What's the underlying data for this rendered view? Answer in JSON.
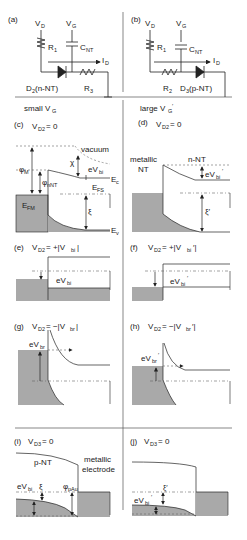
{
  "panels": {
    "a": {
      "label": "(a)",
      "vd": "V",
      "vd_sub": "D",
      "vg": "V",
      "vg_sub": "G",
      "r1": "R",
      "r1_sub": "1",
      "cnt": "C",
      "cnt_sub": "NT",
      "id": "I",
      "id_sub": "D",
      "diode": "D",
      "diode_sub": "2",
      "diode_type": " (n-NT)",
      "r3": "R",
      "r3_sub": "3",
      "cap_signs": "+|+"
    },
    "b": {
      "label": "(b)",
      "vd": "V",
      "vd_sub": "D",
      "vg": "V",
      "vg_sub": "G",
      "r1": "R",
      "r1_sub": "1",
      "cnt": "C",
      "cnt_sub": "NT",
      "id": "I",
      "id_sub": "D",
      "r2": "R",
      "r2_sub": "2",
      "diode": "D",
      "diode_sub": "3",
      "diode_type": " (p-NT)",
      "cap_signs": "+|+"
    },
    "header_left": {
      "text": "small V",
      "sub": "G"
    },
    "header_right": {
      "text": "large V",
      "sub": "G",
      "prime": "′"
    },
    "c": {
      "label": "(c)",
      "cond": "V",
      "cond_sub": "D2",
      "cond_val": " = 0",
      "vacuum": "vacuum",
      "phi_m": "φ",
      "phi_m_sub": "M",
      "chi": "χ",
      "phi_nnt": "φ",
      "phi_nnt_sub": "nNT",
      "evbi": "eV",
      "evbi_sub": "bi",
      "ec": "E",
      "ec_sub": "c",
      "efs": "E",
      "efs_sub": "FS",
      "efm": "E",
      "efm_sub": "FM",
      "xi": "ξ",
      "ev": "E",
      "ev_sub": "v"
    },
    "d": {
      "label": "(d)",
      "cond": "V",
      "cond_sub": "D2",
      "cond_val": " = 0",
      "metallic": "metallic",
      "nt": "NT",
      "nnt": "n-NT",
      "evbi": "eV",
      "evbi_sub": "bi",
      "prime": "′",
      "xi": "ξ′"
    },
    "e": {
      "label": "(e)",
      "cond": "V",
      "cond_sub": "D2",
      "cond_val": " = +|V",
      "cond_sub2": "bi",
      "cond_end": "|",
      "evbi": "eV",
      "evbi_sub": "bi"
    },
    "f": {
      "label": "(f)",
      "cond": "V",
      "cond_sub": "D2",
      "cond_val": " = +|V",
      "cond_sub2": "bi",
      "cond_end": "′|",
      "evbi": "eV",
      "evbi_sub": "bi",
      "prime": "′"
    },
    "g": {
      "label": "(g)",
      "cond": "V",
      "cond_sub": "D2",
      "cond_val": " = −|V",
      "cond_sub2": "br",
      "cond_end": "|",
      "evbr": "eV",
      "evbr_sub": "br"
    },
    "h": {
      "label": "(h)",
      "cond": "V",
      "cond_sub": "D2",
      "cond_val": " = −|V",
      "cond_sub2": "br",
      "cond_end": "′|",
      "evbr": "eV",
      "evbr_sub": "br",
      "prime": "′"
    },
    "i": {
      "label": "(i)",
      "cond": "V",
      "cond_sub": "D3",
      "cond_val": " = 0",
      "pnt": "p-NT",
      "metallic": "metallic",
      "electrode": "electrode",
      "evbi": "eV",
      "evbi_sub": "bi",
      "xi": "ξ",
      "phi_pau": "φ",
      "phi_pau_sub": "pAu"
    },
    "j": {
      "label": "(j)",
      "cond": "V",
      "cond_sub": "D3",
      "cond_val": " = 0",
      "xi": "ξ′",
      "evbi": "eV",
      "evbi_sub": "bi",
      "prime": "′"
    }
  },
  "colors": {
    "fill": "#a9a9a9",
    "line": "#333333",
    "dash": "#666666"
  }
}
